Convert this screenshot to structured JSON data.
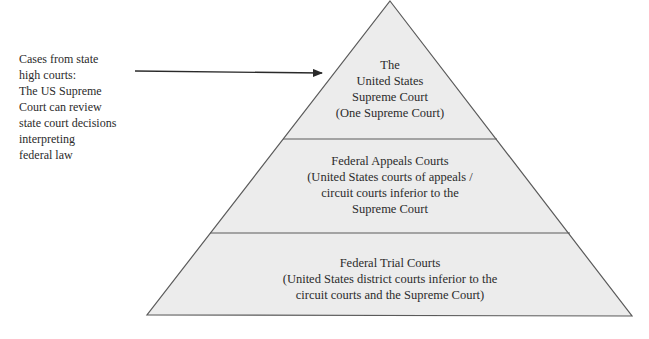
{
  "diagram": {
    "type": "pyramid",
    "colors": {
      "fill": "#ececec",
      "stroke": "#5a5a5a",
      "text": "#2b2b2b",
      "arrow": "#2a2a2a"
    },
    "side_note": {
      "lines": [
        "Cases from state",
        "high courts:",
        "The US Supreme",
        "Court can review",
        "state court decisions",
        "interpreting",
        "federal law"
      ]
    },
    "tiers": [
      {
        "level": "top",
        "lines": [
          "The",
          "United States",
          "Supreme Court",
          "(One Supreme Court)"
        ]
      },
      {
        "level": "middle",
        "lines": [
          "Federal Appeals Courts",
          "(United States courts of appeals /",
          "circuit courts inferior to the",
          "Supreme Court"
        ]
      },
      {
        "level": "bottom",
        "lines": [
          "Federal Trial Courts",
          "(United States district courts inferior to the",
          "circuit courts and the Supreme Court)"
        ]
      }
    ]
  }
}
